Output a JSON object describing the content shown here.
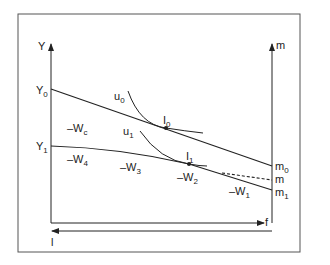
{
  "diagram": {
    "axes": {
      "left_axis_label": "Y",
      "right_axis_label": "m",
      "bottom_right_arrow_label": "f",
      "bottom_left_arrow_label": "l"
    },
    "intercepts": {
      "y0": {
        "base": "Y",
        "sub": "0"
      },
      "y1": {
        "base": "Y",
        "sub": "1"
      },
      "m0": {
        "base": "m",
        "sub": "0"
      },
      "m": {
        "base": "m",
        "sub": ""
      },
      "m1": {
        "base": "m",
        "sub": "1"
      }
    },
    "indifference_curves": [
      {
        "id": "u0",
        "base": "u",
        "sub": "0"
      },
      {
        "id": "u1",
        "base": "u",
        "sub": "1"
      }
    ],
    "tangency_points": [
      {
        "id": "I0",
        "base": "I",
        "sub": "0"
      },
      {
        "id": "I1",
        "base": "I",
        "sub": "1"
      }
    ],
    "wage_labels": [
      {
        "id": "wc",
        "base": "–W",
        "sub": "c"
      },
      {
        "id": "w4",
        "base": "–W",
        "sub": "4"
      },
      {
        "id": "w3",
        "base": "–W",
        "sub": "3"
      },
      {
        "id": "w2",
        "base": "–W",
        "sub": "2"
      },
      {
        "id": "w1",
        "base": "–W",
        "sub": "1"
      }
    ],
    "colors": {
      "line": "#222222",
      "frame": "#555555",
      "background": "#ffffff"
    }
  }
}
